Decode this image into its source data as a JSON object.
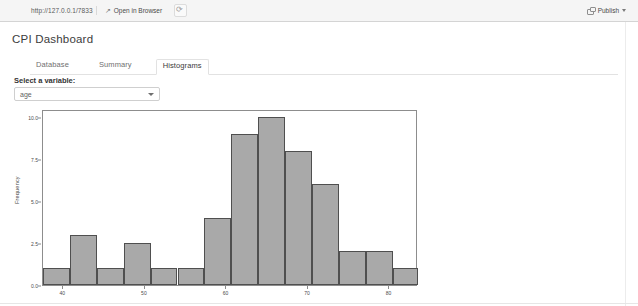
{
  "toolbar": {
    "url": "http://127.0.0.1/7833",
    "open_in_browser_label": "Open in Browser",
    "open_in_browser_arrow": "↗",
    "reload_icon": "reload-icon",
    "publish_label": "Publish",
    "publish_icon": "publish-icon",
    "caret_icon": "chevron-down-icon"
  },
  "app": {
    "title": "CPI Dashboard"
  },
  "tabs": [
    {
      "label": "Database",
      "active": false
    },
    {
      "label": "Summary",
      "active": false
    },
    {
      "label": "Histograms",
      "active": true
    }
  ],
  "variable_selector": {
    "label": "Select a variable:",
    "value": "age",
    "options": [
      "age"
    ],
    "caret_icon": "chevron-down-icon"
  },
  "chart_data": {
    "type": "bar",
    "title": "",
    "xlabel": "",
    "ylabel": "Frequency",
    "grid": false,
    "legend": false,
    "xlim": [
      37.5,
      83.5
    ],
    "ylim": [
      0,
      10.5
    ],
    "yticks": [
      "0.0",
      "2.5",
      "5.0",
      "7.5",
      "10.0"
    ],
    "ytick_values": [
      0,
      2.5,
      5,
      7.5,
      10
    ],
    "xticks": [
      "40",
      "50",
      "60",
      "70",
      "80"
    ],
    "xtick_values": [
      40,
      50,
      60,
      70,
      80
    ],
    "bin_edges": [
      37.5,
      40.8,
      44.1,
      47.4,
      50.7,
      54.0,
      57.3,
      60.6,
      63.9,
      67.2,
      70.5,
      73.8,
      77.1,
      80.4,
      83.5
    ],
    "categories": [
      "37.5-40.8",
      "40.8-44.1",
      "44.1-47.4",
      "47.4-50.7",
      "50.7-54.0",
      "54.0-57.3",
      "57.3-60.6",
      "60.6-63.9",
      "63.9-67.2",
      "67.2-70.5",
      "70.5-73.8",
      "73.8-77.1",
      "77.1-80.4",
      "80.4-83.5"
    ],
    "values": [
      1,
      3,
      1,
      2.5,
      1,
      1,
      4,
      9,
      10,
      8,
      6,
      2,
      2,
      1
    ],
    "bar_color": "#a9a9a9",
    "bar_edge_color": "#4f4f4f"
  }
}
